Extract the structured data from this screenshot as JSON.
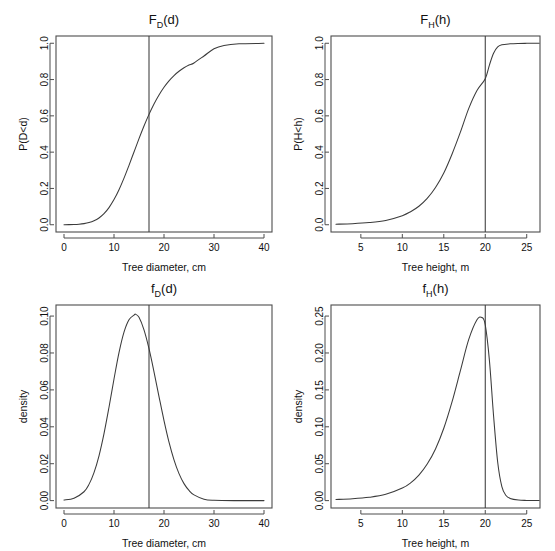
{
  "figure": {
    "background": "#ffffff",
    "line_color": "#3b3b3b",
    "axis_color": "#4d4d4d",
    "layout": "2x2"
  },
  "chart_data": [
    {
      "type": "line",
      "panel": "top-left",
      "title": "F_D(d)",
      "title_base": "F",
      "title_sub": "D",
      "title_tail": "(d)",
      "xlabel": "Tree diameter, cm",
      "ylabel": "P(D<d)",
      "xlim": [
        -1.6,
        41.6
      ],
      "ylim": [
        -0.04,
        1.04
      ],
      "xticks": [
        0,
        10,
        20,
        30,
        40
      ],
      "xticklabels": [
        "0",
        "10",
        "20",
        "30",
        "40"
      ],
      "yticks": [
        0.0,
        0.2,
        0.4,
        0.6,
        0.8,
        1.0
      ],
      "yticklabels": [
        "0.0",
        "0.2",
        "0.4",
        "0.6",
        "0.8",
        "1.0"
      ],
      "grid": false,
      "legend": "none",
      "annotations": [
        {
          "kind": "vline",
          "x": 17,
          "label": "d = 17"
        }
      ],
      "distribution": "normal-cdf",
      "params": {
        "mean": 14.3,
        "sd": 3.95
      },
      "x": [
        0,
        1,
        2,
        3,
        4,
        5,
        6,
        7,
        8,
        9,
        10,
        11,
        12,
        13,
        14,
        15,
        16,
        17,
        18,
        19,
        20,
        21,
        22,
        23,
        24,
        25,
        26,
        28,
        30,
        32,
        35,
        40
      ],
      "y": [
        0.0002,
        0.0006,
        0.0013,
        0.0029,
        0.0061,
        0.0118,
        0.0216,
        0.0374,
        0.0611,
        0.0945,
        0.1385,
        0.1931,
        0.2569,
        0.3274,
        0.401,
        0.4743,
        0.5442,
        0.6083,
        0.6655,
        0.7153,
        0.7577,
        0.7931,
        0.8223,
        0.8458,
        0.8647,
        0.8797,
        0.8916,
        0.93,
        0.97,
        0.988,
        0.997,
        0.9995
      ]
    },
    {
      "type": "line",
      "panel": "top-right",
      "title": "F_H(h)",
      "title_base": "F",
      "title_sub": "H",
      "title_tail": "(h)",
      "xlabel": "Tree height, m",
      "ylabel": "P(H<h)",
      "xlim": [
        1.4,
        26.6
      ],
      "ylim": [
        -0.04,
        1.04
      ],
      "xticks": [
        5,
        10,
        15,
        20,
        25
      ],
      "xticklabels": [
        "5",
        "10",
        "15",
        "20",
        "25"
      ],
      "yticks": [
        0.0,
        0.2,
        0.4,
        0.6,
        0.8,
        1.0
      ],
      "yticklabels": [
        "0.0",
        "0.2",
        "0.4",
        "0.6",
        "0.8",
        "1.0"
      ],
      "grid": false,
      "legend": "none",
      "annotations": [
        {
          "kind": "vline",
          "x": 20,
          "label": "h = 20"
        }
      ],
      "distribution": "skewed-cdf",
      "x": [
        2,
        4,
        6,
        8,
        10,
        11,
        12,
        13,
        14,
        15,
        16,
        17,
        18,
        19,
        20,
        20.5,
        21,
        21.5,
        22,
        23,
        24,
        25,
        26.5
      ],
      "y": [
        0.003,
        0.006,
        0.012,
        0.024,
        0.05,
        0.072,
        0.102,
        0.145,
        0.205,
        0.285,
        0.39,
        0.51,
        0.64,
        0.74,
        0.805,
        0.88,
        0.945,
        0.98,
        0.992,
        0.997,
        0.999,
        0.9995,
        0.9998
      ]
    },
    {
      "type": "line",
      "panel": "bottom-left",
      "title": "f_D(d)",
      "title_base": "f",
      "title_sub": "D",
      "title_tail": "(d)",
      "xlabel": "Tree diameter, cm",
      "ylabel": "density",
      "xlim": [
        -1.6,
        41.6
      ],
      "ylim": [
        -0.004,
        0.106
      ],
      "xticks": [
        0,
        10,
        20,
        30,
        40
      ],
      "xticklabels": [
        "0",
        "10",
        "20",
        "30",
        "40"
      ],
      "yticks": [
        0.0,
        0.02,
        0.04,
        0.06,
        0.08,
        0.1
      ],
      "yticklabels": [
        "0.00",
        "0.02",
        "0.04",
        "0.06",
        "0.08",
        "0.10"
      ],
      "grid": false,
      "legend": "none",
      "annotations": [
        {
          "kind": "vline",
          "x": 17,
          "label": "d = 17"
        }
      ],
      "distribution": "normal-pdf",
      "params": {
        "mean": 14.3,
        "sd": 3.95,
        "peak": 0.101
      },
      "x": [
        0,
        2,
        4,
        5,
        6,
        7,
        8,
        9,
        10,
        11,
        12,
        13,
        14,
        14.3,
        15,
        16,
        17,
        18,
        19,
        20,
        21,
        22,
        23,
        24,
        25,
        26,
        28,
        30,
        34,
        40
      ],
      "y": [
        0.0003,
        0.0013,
        0.0048,
        0.0088,
        0.0152,
        0.0243,
        0.0363,
        0.0506,
        0.0659,
        0.0802,
        0.0913,
        0.098,
        0.1005,
        0.101,
        0.0993,
        0.0925,
        0.0823,
        0.0698,
        0.0564,
        0.0434,
        0.0317,
        0.0221,
        0.0146,
        0.0092,
        0.0055,
        0.0031,
        0.0008,
        0.0002,
        0.0,
        0.0
      ]
    },
    {
      "type": "line",
      "panel": "bottom-right",
      "title": "f_H(h)",
      "title_base": "f",
      "title_sub": "H",
      "title_tail": "(h)",
      "xlabel": "Tree height, m",
      "ylabel": "density",
      "xlim": [
        1.4,
        26.6
      ],
      "ylim": [
        -0.01,
        0.265
      ],
      "xticks": [
        5,
        10,
        15,
        20,
        25
      ],
      "xticklabels": [
        "5",
        "10",
        "15",
        "20",
        "25"
      ],
      "yticks": [
        0.0,
        0.05,
        0.1,
        0.15,
        0.2,
        0.25
      ],
      "yticklabels": [
        "0.00",
        "0.05",
        "0.10",
        "0.15",
        "0.20",
        "0.25"
      ],
      "grid": false,
      "legend": "none",
      "annotations": [
        {
          "kind": "vline",
          "x": 20,
          "label": "h = 20"
        }
      ],
      "distribution": "skewed-pdf",
      "params": {
        "peak": 0.248,
        "peak_x": 19.6
      },
      "x": [
        2,
        4,
        6,
        8,
        10,
        11,
        12,
        13,
        14,
        15,
        16,
        17,
        18,
        19,
        19.6,
        20,
        20.5,
        21,
        21.5,
        22,
        22.5,
        23,
        24,
        25,
        26.5
      ],
      "y": [
        0.0015,
        0.0025,
        0.0045,
        0.0085,
        0.017,
        0.024,
        0.0345,
        0.0495,
        0.07,
        0.098,
        0.134,
        0.176,
        0.218,
        0.245,
        0.248,
        0.238,
        0.19,
        0.115,
        0.052,
        0.019,
        0.007,
        0.003,
        0.0008,
        0.0003,
        0.0001
      ]
    }
  ]
}
